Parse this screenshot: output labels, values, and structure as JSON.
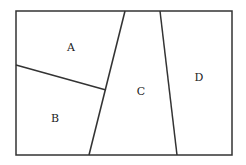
{
  "diagram": {
    "type": "partitioned-rectangle",
    "stroke_color": "#333333",
    "background": "#ffffff",
    "regions": [
      {
        "id": "A",
        "label": "A"
      },
      {
        "id": "B",
        "label": "B"
      },
      {
        "id": "C",
        "label": "C"
      },
      {
        "id": "D",
        "label": "D"
      }
    ]
  }
}
